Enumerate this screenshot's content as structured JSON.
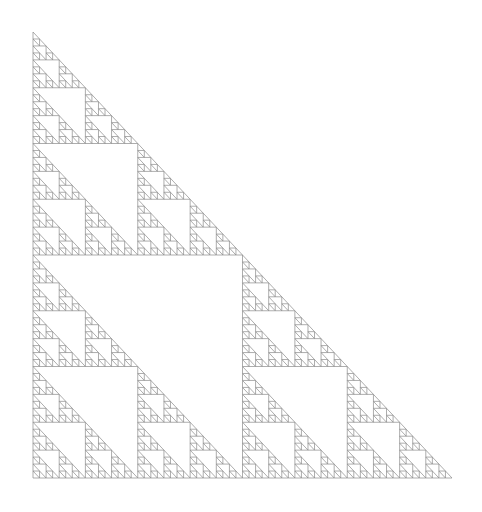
{
  "figure": {
    "type": "fractal"
  },
  "canvas": {
    "width": 482,
    "height": 512,
    "background_color": "#ffffff"
  },
  "fractal": {
    "name": "sierpinski-right-triangle",
    "depth": 6,
    "subdivision_count": 3,
    "orientation": "right-angle-bottom-left",
    "apex": {
      "x": 33,
      "y": 32
    },
    "right_angle": {
      "x": 33,
      "y": 478
    },
    "base_right": {
      "x": 452,
      "y": 478
    },
    "base_width": 419,
    "base_height": 446,
    "smallest_unit_width": 6.55,
    "smallest_unit_height": 6.97,
    "units_across": 64,
    "stroke_color": "#8a8a8a",
    "stroke_width": 0.7,
    "fill": "none"
  },
  "chart_data": {
    "type": "diagram",
    "xlabel": "",
    "ylabel": "",
    "vertices": [
      {
        "label": "apex",
        "x": 33,
        "y": 32
      },
      {
        "label": "bottom-left",
        "x": 33,
        "y": 478
      },
      {
        "label": "bottom-right",
        "x": 452,
        "y": 478
      }
    ],
    "iterations": 6,
    "triangle_count": 729,
    "scale_factor": 0.5,
    "legend": [],
    "grid": false
  }
}
